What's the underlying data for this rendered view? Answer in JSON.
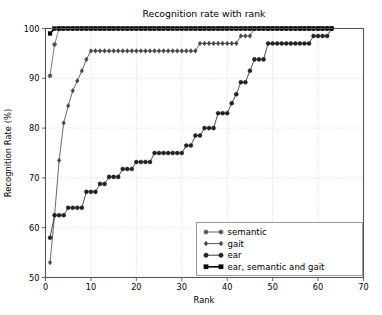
{
  "chart_data": {
    "type": "line",
    "title": "Recognition rate with rank",
    "xlabel": "Rank",
    "ylabel": "Recognition Rate (%)",
    "xlim": [
      0,
      70
    ],
    "ylim": [
      50,
      100
    ],
    "xticks": [
      0,
      10,
      20,
      30,
      40,
      50,
      60,
      70
    ],
    "yticks": [
      50,
      60,
      70,
      80,
      90,
      100
    ],
    "grid": true,
    "legend_position": "lower right",
    "series": [
      {
        "name": "semantic",
        "marker": "circle",
        "color": "#555555",
        "x": [
          1,
          2,
          3,
          4,
          5,
          6,
          7,
          8,
          9,
          10,
          11,
          12,
          13,
          14,
          15,
          16,
          17,
          18,
          19,
          20,
          21,
          22,
          23,
          24,
          25,
          26,
          27,
          28,
          29,
          30,
          31,
          32,
          33,
          34,
          35,
          36,
          37,
          38,
          39,
          40,
          41,
          42,
          43,
          44,
          45,
          46,
          47,
          48,
          49,
          50,
          51,
          52,
          53,
          54,
          55,
          56,
          57,
          58,
          59,
          60,
          61,
          62,
          63
        ],
        "y": [
          90.5,
          96.8,
          100,
          100,
          100,
          100,
          100,
          100,
          100,
          100,
          100,
          100,
          100,
          100,
          100,
          100,
          100,
          100,
          100,
          100,
          100,
          100,
          100,
          100,
          100,
          100,
          100,
          100,
          100,
          100,
          100,
          100,
          100,
          100,
          100,
          100,
          100,
          100,
          100,
          100,
          100,
          100,
          100,
          100,
          100,
          100,
          100,
          100,
          100,
          100,
          100,
          100,
          100,
          100,
          100,
          100,
          100,
          100,
          100,
          100,
          100,
          100,
          100
        ]
      },
      {
        "name": "gait",
        "marker": "diamond",
        "color": "#444444",
        "x": [
          1,
          2,
          3,
          4,
          5,
          6,
          7,
          8,
          9,
          10,
          11,
          12,
          13,
          14,
          15,
          16,
          17,
          18,
          19,
          20,
          21,
          22,
          23,
          24,
          25,
          26,
          27,
          28,
          29,
          30,
          31,
          32,
          33,
          34,
          35,
          36,
          37,
          38,
          39,
          40,
          41,
          42,
          43,
          44,
          45,
          46,
          47,
          48,
          49,
          50,
          51,
          52,
          53,
          54,
          55,
          56,
          57,
          58,
          59,
          60,
          61,
          62,
          63
        ],
        "y": [
          53.0,
          62.5,
          73.5,
          81.0,
          84.5,
          87.5,
          89.5,
          91.5,
          93.8,
          95.5,
          95.5,
          95.5,
          95.5,
          95.5,
          95.5,
          95.5,
          95.5,
          95.5,
          95.5,
          95.5,
          95.5,
          95.5,
          95.5,
          95.5,
          95.5,
          95.5,
          95.5,
          95.5,
          95.5,
          95.5,
          95.5,
          95.5,
          95.5,
          97.0,
          97.0,
          97.0,
          97.0,
          97.0,
          97.0,
          97.0,
          97.0,
          97.0,
          98.5,
          98.5,
          98.5,
          100,
          100,
          100,
          100,
          100,
          100,
          100,
          100,
          100,
          100,
          100,
          100,
          100,
          100,
          100,
          100,
          100,
          100
        ]
      },
      {
        "name": "ear",
        "marker": "circle-filled",
        "color": "#222222",
        "x": [
          1,
          2,
          3,
          4,
          5,
          6,
          7,
          8,
          9,
          10,
          11,
          12,
          13,
          14,
          15,
          16,
          17,
          18,
          19,
          20,
          21,
          22,
          23,
          24,
          25,
          26,
          27,
          28,
          29,
          30,
          31,
          32,
          33,
          34,
          35,
          36,
          37,
          38,
          39,
          40,
          41,
          42,
          43,
          44,
          45,
          46,
          47,
          48,
          49,
          50,
          51,
          52,
          53,
          54,
          55,
          56,
          57,
          58,
          59,
          60,
          61,
          62,
          63
        ],
        "y": [
          58.0,
          62.5,
          62.5,
          62.5,
          64.0,
          64.0,
          64.0,
          64.0,
          67.2,
          67.2,
          67.2,
          68.8,
          68.8,
          70.2,
          70.2,
          70.2,
          71.8,
          71.8,
          71.8,
          73.2,
          73.2,
          73.2,
          73.2,
          75.0,
          75.0,
          75.0,
          75.0,
          75.0,
          75.0,
          75.0,
          76.5,
          76.5,
          78.5,
          78.5,
          80.0,
          80.0,
          80.0,
          83.0,
          83.0,
          83.0,
          85.0,
          86.8,
          89.2,
          89.2,
          91.5,
          93.8,
          93.8,
          93.8,
          97.0,
          97.0,
          97.0,
          97.0,
          97.0,
          97.0,
          97.0,
          97.0,
          97.0,
          97.0,
          98.5,
          98.5,
          98.5,
          98.5,
          100
        ]
      },
      {
        "name": "ear, semantic and gait",
        "marker": "square",
        "color": "#000000",
        "x": [
          1,
          2,
          3,
          4,
          5,
          6,
          7,
          8,
          9,
          10,
          11,
          12,
          13,
          14,
          15,
          16,
          17,
          18,
          19,
          20,
          21,
          22,
          23,
          24,
          25,
          26,
          27,
          28,
          29,
          30,
          31,
          32,
          33,
          34,
          35,
          36,
          37,
          38,
          39,
          40,
          41,
          42,
          43,
          44,
          45,
          46,
          47,
          48,
          49,
          50,
          51,
          52,
          53,
          54,
          55,
          56,
          57,
          58,
          59,
          60,
          61,
          62,
          63
        ],
        "y": [
          99.0,
          100,
          100,
          100,
          100,
          100,
          100,
          100,
          100,
          100,
          100,
          100,
          100,
          100,
          100,
          100,
          100,
          100,
          100,
          100,
          100,
          100,
          100,
          100,
          100,
          100,
          100,
          100,
          100,
          100,
          100,
          100,
          100,
          100,
          100,
          100,
          100,
          100,
          100,
          100,
          100,
          100,
          100,
          100,
          100,
          100,
          100,
          100,
          100,
          100,
          100,
          100,
          100,
          100,
          100,
          100,
          100,
          100,
          100,
          100,
          100,
          100,
          100
        ]
      }
    ]
  },
  "legend": {
    "entries": [
      {
        "label": "semantic"
      },
      {
        "label": "gait"
      },
      {
        "label": "ear"
      },
      {
        "label": "ear, semantic and gait"
      }
    ]
  },
  "colors": {
    "background": "#ffffff",
    "axis": "#555555",
    "grid": "#b0b0b0",
    "text": "#000000"
  }
}
